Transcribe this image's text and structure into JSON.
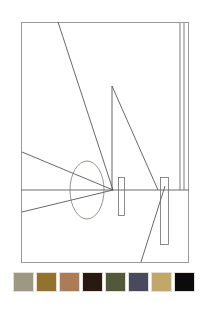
{
  "artwork": {
    "title": "Abstract perspective line drawing",
    "background_color": "#ffffff",
    "line_color": "#58585a",
    "frame_color": "#9a9a9a",
    "frame": {
      "x": 21,
      "y": 22,
      "width": 168,
      "height": 241
    },
    "elements": [
      {
        "name": "horizon-line",
        "type": "line",
        "x1": 21,
        "y1": 190,
        "x2": 189,
        "y2": 190
      },
      {
        "name": "long-diagonal-upper-left",
        "type": "line",
        "x1": 58,
        "y1": 22,
        "x2": 113,
        "y2": 190
      },
      {
        "name": "vertical-spire",
        "type": "line",
        "x1": 112,
        "y1": 86,
        "x2": 112,
        "y2": 190
      },
      {
        "name": "spire-hypotenuse",
        "type": "line",
        "x1": 112,
        "y1": 86,
        "x2": 158,
        "y2": 190
      },
      {
        "name": "converging-line-upper",
        "type": "line",
        "x1": 22,
        "y1": 152,
        "x2": 113,
        "y2": 190
      },
      {
        "name": "converging-line-lower",
        "type": "line",
        "x1": 22,
        "y1": 212,
        "x2": 113,
        "y2": 190
      },
      {
        "name": "steep-diagonal-lower-right",
        "type": "line",
        "x1": 165,
        "y1": 186,
        "x2": 141,
        "y2": 262
      },
      {
        "name": "right-vertical-inner",
        "type": "line",
        "x1": 180,
        "y1": 22,
        "x2": 180,
        "y2": 190
      },
      {
        "name": "right-vertical-outer",
        "type": "line",
        "x1": 184,
        "y1": 22,
        "x2": 184,
        "y2": 190
      },
      {
        "name": "ellipse-overlay",
        "type": "ellipse",
        "cx": 87,
        "cy": 190,
        "rx": 17,
        "ry": 29
      },
      {
        "name": "rectangle-post-left",
        "type": "rect",
        "x": 118,
        "y": 177,
        "width": 7,
        "height": 39
      },
      {
        "name": "rectangle-post-right",
        "type": "rect",
        "x": 160,
        "y": 177,
        "width": 9,
        "height": 68
      }
    ]
  },
  "palette": {
    "name": "color-palette-strip",
    "swatch_count": 8,
    "swatches": [
      {
        "name": "swatch-1",
        "label": "grey olive",
        "color": "#9d9884"
      },
      {
        "name": "swatch-2",
        "label": "ochre brown",
        "color": "#93712e"
      },
      {
        "name": "swatch-3",
        "label": "tan sienna",
        "color": "#ab7c56"
      },
      {
        "name": "swatch-4",
        "label": "dark chocolate",
        "color": "#281a10"
      },
      {
        "name": "swatch-5",
        "label": "olive green",
        "color": "#52593a"
      },
      {
        "name": "swatch-6",
        "label": "slate indigo",
        "color": "#4a4a5e"
      },
      {
        "name": "swatch-7",
        "label": "khaki gold",
        "color": "#c2a868"
      },
      {
        "name": "swatch-8",
        "label": "black",
        "color": "#0b0b0b"
      }
    ]
  }
}
